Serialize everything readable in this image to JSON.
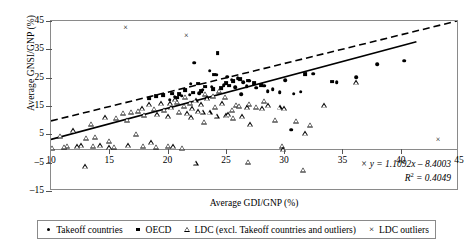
{
  "chart_data": {
    "type": "scatter",
    "title": "",
    "xlabel": "Average GDI/GNP (%)",
    "ylabel": "Average GNSI/GNP (%)",
    "xlim": [
      10,
      45
    ],
    "ylim": [
      -15,
      45
    ],
    "xticks": [
      10,
      15,
      20,
      25,
      30,
      35,
      40,
      45
    ],
    "yticks": [
      -15,
      -5,
      5,
      15,
      25,
      35,
      45
    ],
    "grid": false,
    "legend_position": "bottom",
    "annotations": [
      "y = 1.1092x - 8.4003",
      "R² = 0.4049"
    ],
    "trendlines": [
      {
        "name": "solid-regression-line",
        "style": "solid",
        "equation": "y = 1.1092x - 8.4003",
        "r_squared": 0.4049,
        "slope": 1.1092,
        "intercept": -8.4003,
        "x_start": 10,
        "x_end": 41.5,
        "y_start": 2.7,
        "y_end": 37.6
      },
      {
        "name": "dashed-reference-line",
        "style": "dashed",
        "slope": 1.04,
        "intercept": -1.1,
        "x_start": 10,
        "x_end": 45,
        "y_start": 9.3,
        "y_end": 45.0
      }
    ],
    "series": [
      {
        "name": "Takeoff countries",
        "marker": "filled-circle",
        "color": "#000000",
        "points": [
          [
            22.3,
            30.2
          ],
          [
            23.6,
            27.5
          ],
          [
            24.2,
            26.0
          ],
          [
            25.1,
            25.3
          ],
          [
            25.5,
            24.2
          ],
          [
            26.0,
            24.8
          ],
          [
            26.5,
            23.4
          ],
          [
            27.0,
            23.9
          ],
          [
            24.8,
            22.4
          ],
          [
            25.8,
            21.6
          ],
          [
            23.0,
            20.7
          ],
          [
            21.9,
            19.0
          ],
          [
            22.7,
            19.6
          ],
          [
            21.2,
            18.6
          ],
          [
            20.6,
            18.2
          ],
          [
            23.4,
            18.0
          ],
          [
            26.8,
            22.0
          ],
          [
            27.6,
            21.4
          ],
          [
            28.3,
            22.2
          ],
          [
            29.0,
            21.0
          ],
          [
            30.1,
            24.1
          ],
          [
            32.5,
            26.4
          ],
          [
            34.5,
            23.4
          ],
          [
            36.2,
            25.2
          ],
          [
            38.0,
            29.8
          ],
          [
            40.3,
            30.9
          ],
          [
            28.6,
            20.3
          ],
          [
            29.6,
            19.8
          ],
          [
            30.8,
            19.4
          ],
          [
            31.4,
            20.1
          ],
          [
            30.6,
            6.6
          ],
          [
            26.3,
            19.2
          ],
          [
            24.4,
            20.0
          ],
          [
            23.8,
            21.8
          ],
          [
            22.0,
            22.8
          ],
          [
            20.2,
            17.2
          ]
        ]
      },
      {
        "name": "OECD",
        "marker": "filled-square",
        "color": "#000000",
        "points": [
          [
            24.3,
            33.6
          ],
          [
            24.0,
            26.1
          ],
          [
            22.6,
            22.9
          ],
          [
            23.2,
            21.9
          ],
          [
            21.5,
            20.5
          ],
          [
            20.4,
            19.4
          ],
          [
            19.6,
            18.9
          ],
          [
            19.0,
            18.4
          ],
          [
            25.0,
            23.2
          ],
          [
            25.6,
            23.8
          ],
          [
            26.2,
            24.4
          ],
          [
            25.3,
            22.2
          ],
          [
            24.6,
            21.4
          ],
          [
            23.9,
            20.9
          ],
          [
            22.9,
            20.2
          ],
          [
            22.2,
            19.7
          ],
          [
            21.0,
            19.1
          ],
          [
            20.8,
            18.0
          ],
          [
            26.9,
            24.0
          ],
          [
            27.4,
            23.2
          ],
          [
            28.0,
            22.5
          ],
          [
            31.8,
            26.2
          ],
          [
            34.1,
            23.6
          ],
          [
            18.4,
            17.6
          ]
        ]
      },
      {
        "name": "LDC (excl. Takeoff countries and outliers)",
        "marker": "open-triangle",
        "color": "#000000",
        "points": [
          [
            10.1,
            0.2
          ],
          [
            10.8,
            4.6
          ],
          [
            11.4,
            1.0
          ],
          [
            11.9,
            6.4
          ],
          [
            12.6,
            1.2
          ],
          [
            13.0,
            3.9
          ],
          [
            13.4,
            8.8
          ],
          [
            13.8,
            4.2
          ],
          [
            14.2,
            1.1
          ],
          [
            14.6,
            11.0
          ],
          [
            15.0,
            0.4
          ],
          [
            15.0,
            2.8
          ],
          [
            15.6,
            10.8
          ],
          [
            16.2,
            12.6
          ],
          [
            16.5,
            10.2
          ],
          [
            16.9,
            13.0
          ],
          [
            17.3,
            5.1
          ],
          [
            17.5,
            13.4
          ],
          [
            17.8,
            14.2
          ],
          [
            18.0,
            11.9
          ],
          [
            18.4,
            15.6
          ],
          [
            18.8,
            14.0
          ],
          [
            19.1,
            12.1
          ],
          [
            19.4,
            16.0
          ],
          [
            19.7,
            13.6
          ],
          [
            20.0,
            11.4
          ],
          [
            20.0,
            1.0
          ],
          [
            20.3,
            14.6
          ],
          [
            20.5,
            0.8
          ],
          [
            20.8,
            16.6
          ],
          [
            21.0,
            13.0
          ],
          [
            21.2,
            0.3
          ],
          [
            21.4,
            15.0
          ],
          [
            21.7,
            12.4
          ],
          [
            21.9,
            16.2
          ],
          [
            22.1,
            14.2
          ],
          [
            22.4,
            17.0
          ],
          [
            22.6,
            13.2
          ],
          [
            22.9,
            15.6
          ],
          [
            23.1,
            9.4
          ],
          [
            23.4,
            17.8
          ],
          [
            23.6,
            12.8
          ],
          [
            23.9,
            18.6
          ],
          [
            24.1,
            14.8
          ],
          [
            24.4,
            20.4
          ],
          [
            24.7,
            16.0
          ],
          [
            25.0,
            11.8
          ],
          [
            25.2,
            12.1
          ],
          [
            25.6,
            10.8
          ],
          [
            25.9,
            15.4
          ],
          [
            26.1,
            15.0
          ],
          [
            26.4,
            11.4
          ],
          [
            26.8,
            14.6
          ],
          [
            27.1,
            8.6
          ],
          [
            27.6,
            14.8
          ],
          [
            28.1,
            14.2
          ],
          [
            28.6,
            15.2
          ],
          [
            29.2,
            10.2
          ],
          [
            29.6,
            14.6
          ],
          [
            30.0,
            14.2
          ],
          [
            31.0,
            9.8
          ],
          [
            31.8,
            5.4
          ],
          [
            32.2,
            8.4
          ],
          [
            33.4,
            15.2
          ],
          [
            29.8,
            0.9
          ],
          [
            29.9,
            -0.2
          ],
          [
            22.4,
            -5.1
          ],
          [
            26.9,
            -4.6
          ],
          [
            12.9,
            -6.3
          ],
          [
            31.6,
            -7.6
          ],
          [
            19.0,
            0.6
          ],
          [
            17.9,
            1.0
          ],
          [
            16.6,
            1.2
          ],
          [
            15.4,
            0.7
          ],
          [
            13.6,
            0.9
          ],
          [
            12.2,
            0.8
          ],
          [
            11.1,
            0.6
          ],
          [
            36.2,
            23.4
          ],
          [
            24.9,
            18.2
          ],
          [
            23.2,
            19.4
          ],
          [
            20.6,
            17.4
          ],
          [
            21.5,
            18.2
          ],
          [
            22.0,
            11.0
          ],
          [
            24.2,
            11.6
          ],
          [
            25.5,
            13.6
          ],
          [
            27.0,
            15.8
          ],
          [
            28.3,
            16.8
          ],
          [
            18.6,
            2.2
          ],
          [
            20.2,
            16.0
          ],
          [
            23.0,
            13.0
          ]
        ]
      },
      {
        "name": "LDC outliers",
        "marker": "x-cross",
        "color": "#000000",
        "points": [
          [
            16.4,
            42.6
          ],
          [
            21.6,
            39.6
          ],
          [
            43.2,
            3.0
          ],
          [
            11.2,
            -16.2
          ]
        ]
      }
    ]
  },
  "axis": {
    "y_title": "Average GNSI/GNP (%)",
    "x_title": "Average GDI/GNP (%)",
    "y_ticks": [
      "45",
      "35",
      "25",
      "15",
      "5",
      "–5",
      "–15"
    ],
    "x_ticks": [
      "10",
      "15",
      "20",
      "25",
      "30",
      "35",
      "40",
      "45"
    ]
  },
  "equation": {
    "line1": "y = 1.1092x – 8.4003",
    "r2_label": "R",
    "r2_sup": "2",
    "r2_value": " = 0.4049"
  },
  "legend": {
    "items": [
      {
        "symbol": "filled-circle",
        "label": "Takeoff countries"
      },
      {
        "symbol": "filled-square",
        "label": "OECD"
      },
      {
        "symbol": "open-triangle",
        "label": "LDC (excl. Takeoff countries and outliers)"
      },
      {
        "symbol": "x-cross",
        "label": "LDC outliers"
      }
    ]
  },
  "colors": {
    "frame": "#8a8a8a",
    "marker": "#000000",
    "background": "#ffffff"
  }
}
